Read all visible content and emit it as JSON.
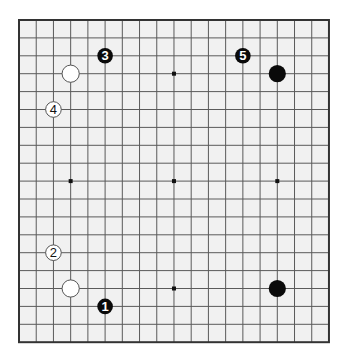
{
  "diagram": {
    "type": "go-board",
    "board_size": 19,
    "colors": {
      "page_background": "#ffffff",
      "board_fill": "#f1f1f1",
      "grid_line": "#5a5a5a",
      "border_line": "#333333",
      "star_point": "#111111",
      "black_stone": "#0a0a0a",
      "white_stone": "#ffffff",
      "white_stone_outline": "#555555"
    },
    "geometry": {
      "left": 19,
      "top": 20,
      "col_spacing": 17.22,
      "row_spacing": 17.9
    },
    "star_points": [
      {
        "col": 3,
        "row": 3
      },
      {
        "col": 9,
        "row": 3
      },
      {
        "col": 15,
        "row": 3
      },
      {
        "col": 3,
        "row": 9
      },
      {
        "col": 9,
        "row": 9
      },
      {
        "col": 15,
        "row": 9
      },
      {
        "col": 3,
        "row": 15
      },
      {
        "col": 9,
        "row": 15
      },
      {
        "col": 15,
        "row": 15
      }
    ],
    "stones": [
      {
        "color": "white",
        "col": 3,
        "row": 3,
        "label": ""
      },
      {
        "color": "black",
        "col": 15,
        "row": 3,
        "label": ""
      },
      {
        "color": "white",
        "col": 3,
        "row": 15,
        "label": ""
      },
      {
        "color": "black",
        "col": 15,
        "row": 15,
        "label": ""
      },
      {
        "color": "black",
        "col": 5,
        "row": 16,
        "label": "1"
      },
      {
        "color": "white",
        "col": 2,
        "row": 13,
        "label": "2"
      },
      {
        "color": "black",
        "col": 5,
        "row": 2,
        "label": "3"
      },
      {
        "color": "white",
        "col": 2,
        "row": 5,
        "label": "4"
      },
      {
        "color": "black",
        "col": 13,
        "row": 2,
        "label": "5"
      }
    ]
  }
}
